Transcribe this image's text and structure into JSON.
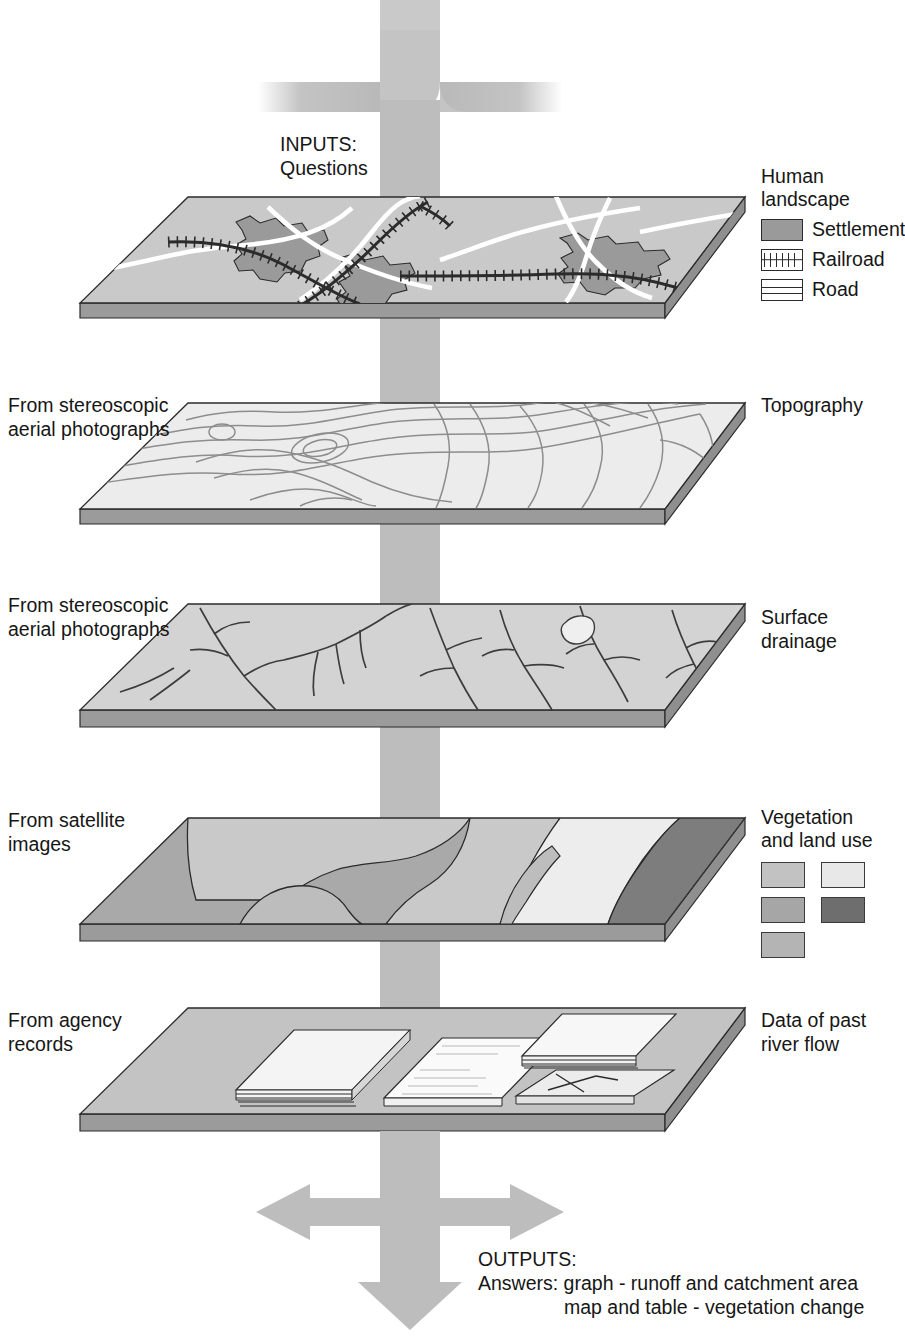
{
  "diagram": {
    "inputs": {
      "line1": "INPUTS:",
      "line2": "Questions"
    },
    "outputs": {
      "line1": "OUTPUTS:",
      "line2": "Answers: graph - runoff and catchment area",
      "line3": "map and table - vegetation change"
    },
    "layers": [
      {
        "id": "human-landscape",
        "source_label": "",
        "right_title": "Human\nlandscape",
        "legend_items": [
          {
            "label": "Settlement",
            "icon": "settlement-swatch",
            "color": "#9a9a9a"
          },
          {
            "label": "Railroad",
            "icon": "railroad-swatch",
            "color": "#ffffff"
          },
          {
            "label": "Road",
            "icon": "road-swatch",
            "color": "#ffffff"
          }
        ]
      },
      {
        "id": "topography",
        "source_label": "From stereoscopic\naerial photographs",
        "right_title": "Topography",
        "legend_items": []
      },
      {
        "id": "surface-drainage",
        "source_label": "From stereoscopic\naerial photographs",
        "right_title": "Surface\ndrainage",
        "legend_items": []
      },
      {
        "id": "vegetation-land-use",
        "source_label": "From satellite\nimages",
        "right_title": "Vegetation\nand land use",
        "legend_items": [
          {
            "label": "",
            "icon": "veg-swatch-1",
            "color": "#c2c2c2"
          },
          {
            "label": "",
            "icon": "veg-swatch-2",
            "color": "#e8e8e8"
          },
          {
            "label": "",
            "icon": "veg-swatch-3",
            "color": "#a6a6a6"
          },
          {
            "label": "",
            "icon": "veg-swatch-4",
            "color": "#6e6e6e"
          },
          {
            "label": "",
            "icon": "veg-swatch-5",
            "color": "#b4b4b4"
          }
        ]
      },
      {
        "id": "past-river-flow-records",
        "source_label": "From agency\nrecords",
        "right_title": "Data of past\nriver flow",
        "legend_items": []
      }
    ],
    "colors": {
      "arrow": "#b9b9b9",
      "slab_top_light": "#efefef",
      "slab_top_mid": "#cfcfcf",
      "slab_side": "#a0a0a0",
      "outline": "#2b2b2b",
      "settlement": "#9a9a9a",
      "road": "#ffffff",
      "railroad": "#2b2b2b",
      "contour": "#8a8a8a",
      "stream": "#4a4a4a",
      "paper": "#f7f7f7"
    }
  }
}
